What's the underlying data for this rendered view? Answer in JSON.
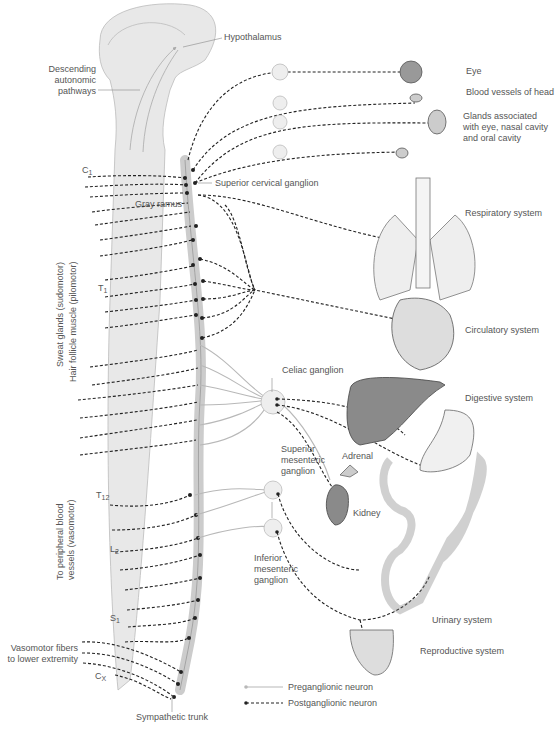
{
  "figure": {
    "labels": {
      "hypothalamus": "Hypothalamus",
      "descending": [
        "Descending",
        "autonomic",
        "pathways"
      ],
      "c1": "C",
      "c1_sub": "1",
      "gray_ramus": "Gray ramus",
      "superior_cervical_ganglion": "Superior cervical ganglion",
      "t1": "T",
      "t1_sub": "1",
      "t12": "T",
      "t12_sub": "12",
      "l2": "L",
      "l2_sub": "2",
      "s1": "S",
      "s1_sub": "1",
      "cx": "C",
      "cx_sub": "X",
      "celiac_ganglion": "Celiac ganglion",
      "superior_mesenteric_ganglion": [
        "Superior",
        "mesenteric",
        "ganglion"
      ],
      "inferior_mesenteric_ganglion": [
        "Inferior",
        "mesenteric",
        "ganglion"
      ],
      "adrenal": "Adrenal",
      "kidney": "Kidney",
      "sympathetic_trunk": "Sympathetic trunk",
      "vasomotor_lower": [
        "Vasomotor fibers",
        "to lower extremity"
      ],
      "sweat_glands": "Sweat glands (sudomotor)",
      "hair_follicle": "Hair follicle muscle (pilomotor)",
      "peripheral_vessels": [
        "To peripheral blood",
        "vessels (vasomotor)"
      ]
    },
    "targets": {
      "eye": "Eye",
      "blood_vessels_head": "Blood vessels of head",
      "glands": [
        "Glands associated",
        "with eye, nasal cavity",
        "and oral cavity"
      ],
      "respiratory": "Respiratory system",
      "circulatory": "Circulatory system",
      "digestive": "Digestive system",
      "urinary": "Urinary system",
      "reproductive": "Reproductive system"
    },
    "legend": {
      "preganglionic": "Preganglionic neuron",
      "postganglionic": "Postganglionic neuron"
    },
    "colors": {
      "pre": "#b8b8b8",
      "post": "#222222",
      "organ_dark": "#8a8a8a",
      "organ_light": "#ececec",
      "cord": "#e8e8e8"
    }
  }
}
